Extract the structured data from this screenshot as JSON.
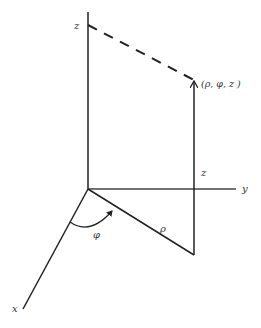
{
  "diagram": {
    "colors": {
      "line": "#222222",
      "text": "#333333",
      "background": "#ffffff"
    },
    "labels": {
      "z_axis": "z",
      "y_axis": "y",
      "x_axis": "x",
      "point": "(ρ, φ, z )",
      "height": "z",
      "radius": "ρ",
      "angle": "φ"
    }
  }
}
